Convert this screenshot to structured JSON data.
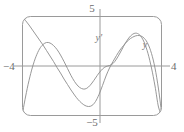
{
  "figure": {
    "kind": "graphing-calculator-viewport",
    "frame": {
      "stroke_color": "#9a9a9a",
      "corner_radius_px": 8,
      "x_px": 22,
      "y_px": 16,
      "width_px": 140,
      "height_px": 100
    },
    "axes": {
      "stroke_color": "#9a9a9a",
      "origin_px": {
        "x": 100,
        "y": 66
      }
    }
  },
  "axis_labels": {
    "top": "5",
    "bottom": "−5",
    "left": "−4",
    "right": "4"
  },
  "curve_labels": {
    "derivative": "y'",
    "function": "y"
  },
  "chart_data": {
    "type": "line",
    "title": "",
    "subtitle": "",
    "xlabel": "",
    "ylabel": "",
    "xlim": [
      -4,
      4
    ],
    "ylim": [
      -5,
      5
    ],
    "xticks": [
      -4,
      4
    ],
    "yticks": [
      -5,
      5
    ],
    "xticklabels": [
      "−4",
      "4"
    ],
    "yticklabels": [
      "−5",
      "5"
    ],
    "grid": false,
    "axes_visible": true,
    "legend": "inline-curve-labels",
    "legend_position": "inline",
    "series": [
      {
        "name": "y",
        "label": "y",
        "color": "#8c8c8c",
        "label_point": {
          "x": 2.9,
          "y": 2.6
        },
        "x": [
          -4.0,
          -3.8,
          -3.6,
          -3.4,
          -3.2,
          -3.0,
          -2.8,
          -2.6,
          -2.4,
          -2.2,
          -2.0,
          -1.8,
          -1.6,
          -1.4,
          -1.2,
          -1.0,
          -0.8,
          -0.6,
          -0.4,
          -0.2,
          0.0,
          0.2,
          0.4,
          0.6,
          0.8,
          1.0,
          1.2,
          1.4,
          1.6,
          1.8,
          2.0,
          2.2,
          2.4,
          2.6,
          2.8,
          3.0,
          3.2,
          3.4,
          3.6,
          3.8,
          4.0
        ],
        "y": [
          -5.0,
          -3.1,
          -1.45,
          -0.1,
          0.95,
          1.7,
          2.15,
          2.35,
          2.3,
          2.05,
          1.65,
          1.1,
          0.45,
          -0.25,
          -0.95,
          -1.55,
          -2.0,
          -2.25,
          -2.3,
          -2.1,
          -1.7,
          -1.2,
          -0.7,
          -0.3,
          -0.05,
          0.05,
          0.25,
          0.7,
          1.3,
          1.95,
          2.55,
          3.0,
          3.25,
          3.25,
          2.95,
          2.3,
          1.25,
          -0.2,
          -2.0,
          -4.1,
          -5.0
        ],
        "description": "higher-degree polynomial: enters bottom-left, rises to a local max near x=-2.6, falls to a local min near x=-0.4, flattens near the origin, rises to a global max near x=2.5, then plunges off the bottom-right"
      },
      {
        "name": "y'",
        "label": "y'",
        "color": "#8c8c8c",
        "label_point": {
          "x": 0.2,
          "y": 3.3
        },
        "x": [
          -4.0,
          -3.8,
          -3.6,
          -3.4,
          -3.2,
          -3.0,
          -2.8,
          -2.6,
          -2.4,
          -2.2,
          -2.0,
          -1.8,
          -1.6,
          -1.4,
          -1.2,
          -1.0,
          -0.8,
          -0.6,
          -0.4,
          -0.2,
          0.0,
          0.2,
          0.4,
          0.6,
          0.8,
          1.0,
          1.2,
          1.4,
          1.6,
          1.8,
          2.0,
          2.2,
          2.4,
          2.6,
          2.8,
          3.0,
          3.2,
          3.4,
          3.6,
          3.8,
          4.0
        ],
        "y": [
          5.0,
          4.55,
          4.1,
          3.6,
          3.1,
          2.6,
          2.1,
          1.55,
          1.0,
          0.45,
          -0.15,
          -0.7,
          -1.3,
          -1.85,
          -2.4,
          -2.9,
          -3.35,
          -3.7,
          -3.95,
          -4.05,
          -3.95,
          -3.55,
          -2.85,
          -1.95,
          -1.0,
          -0.2,
          0.45,
          1.05,
          1.6,
          2.05,
          2.45,
          2.75,
          2.95,
          3.05,
          3.0,
          2.75,
          2.2,
          1.25,
          -0.2,
          -2.3,
          -5.0
        ],
        "description": "derivative curve: a near-straight steep descending segment from the top-left crossing zero around x=-2.1, dipping to a minimum near x=-0.2, rising back through zero near x=1.05 to a max near x=2.6, then dropping steeply off the bottom-right"
      }
    ]
  }
}
